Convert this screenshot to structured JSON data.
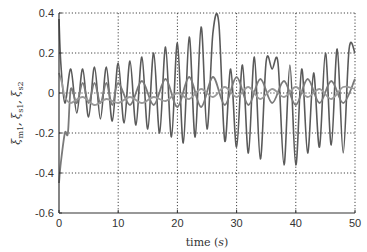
{
  "chart_data": {
    "type": "line",
    "title": "",
    "xlabel": "time (s)",
    "xlabel_main": "time",
    "xlabel_unit": "s",
    "ylabel": "ξm1, ξs1, ξs2",
    "ylabel_parts": [
      "ξ",
      "m1",
      ", ξ",
      "s1",
      ", ξ",
      "s2"
    ],
    "xlim": [
      0,
      50
    ],
    "ylim": [
      -0.6,
      0.4
    ],
    "xticks": [
      0,
      10,
      20,
      30,
      40,
      50
    ],
    "yticks": [
      -0.6,
      -0.4,
      -0.2,
      0,
      0.2,
      0.4
    ],
    "xtick_labels": [
      "0",
      "10",
      "20",
      "30",
      "40",
      "50"
    ],
    "ytick_labels": [
      "-0.6",
      "-0.4",
      "-0.2",
      "0",
      "0.2",
      "0.4"
    ],
    "grid": true,
    "legend": null,
    "series": [
      {
        "name": "ξm1",
        "color": "#5a5a5a",
        "description": "large oscillation, amplitude growing from ~0.12 to ~0.35 peak, troughs to ~-0.35; initial transient from 0.37",
        "x": [
          0,
          0.3,
          1,
          2,
          3,
          4,
          5,
          6,
          7,
          8,
          9,
          10,
          11,
          12,
          13,
          14,
          15,
          16,
          17,
          18,
          19,
          20,
          21,
          22,
          23,
          24,
          25,
          26,
          27,
          28,
          29,
          30,
          31,
          32,
          33,
          34,
          35,
          36,
          37,
          38,
          39,
          40,
          41,
          42,
          43,
          44,
          45,
          46,
          47,
          48,
          49,
          50
        ],
        "values": [
          0.37,
          0.15,
          -0.05,
          0.12,
          -0.1,
          0.12,
          -0.12,
          0.13,
          -0.13,
          0.13,
          -0.14,
          0.15,
          -0.15,
          0.16,
          -0.16,
          0.18,
          -0.18,
          0.2,
          -0.2,
          0.23,
          -0.22,
          0.25,
          -0.25,
          0.28,
          -0.22,
          0.33,
          -0.18,
          0.3,
          0.35,
          -0.24,
          0.12,
          -0.27,
          0.14,
          -0.3,
          0.18,
          -0.33,
          0.16,
          0.12,
          0.15,
          -0.36,
          0.14,
          -0.36,
          0.12,
          -0.3,
          0.1,
          -0.27,
          0.2,
          -0.26,
          0.22,
          -0.3,
          0.22,
          0.2
        ]
      },
      {
        "name": "ξs1",
        "color": "#7a7a7a",
        "description": "medium oscillation around 0, amplitude ~0.05-0.1; initial transient dipping to -0.45",
        "x": [
          0,
          0.3,
          1,
          1.5,
          2,
          3,
          4,
          5,
          6,
          7,
          8,
          9,
          10,
          12,
          14,
          16,
          18,
          20,
          22,
          24,
          26,
          28,
          30,
          32,
          34,
          36,
          38,
          40,
          42,
          44,
          46,
          48,
          50
        ],
        "values": [
          -0.45,
          -0.35,
          -0.2,
          -0.2,
          0.02,
          -0.05,
          0.05,
          -0.05,
          0.05,
          -0.05,
          0.05,
          -0.06,
          0.05,
          -0.06,
          0.06,
          -0.06,
          0.07,
          -0.07,
          0.08,
          -0.07,
          0.08,
          -0.06,
          0.08,
          -0.06,
          0.07,
          -0.05,
          0.06,
          -0.06,
          0.07,
          -0.05,
          0.06,
          -0.05,
          0.07
        ]
      },
      {
        "name": "ξs2",
        "color": "#9a9a9a",
        "description": "small oscillation slightly below 0, ~-0.05 to 0.03",
        "x": [
          0,
          0.5,
          1,
          2,
          4,
          6,
          8,
          10,
          12,
          14,
          16,
          18,
          20,
          22,
          24,
          26,
          28,
          30,
          32,
          34,
          36,
          38,
          40,
          42,
          44,
          46,
          48,
          50
        ],
        "values": [
          0.1,
          0.05,
          -0.02,
          -0.05,
          -0.02,
          -0.06,
          -0.03,
          -0.05,
          -0.02,
          -0.05,
          -0.02,
          -0.04,
          0.0,
          -0.03,
          0.02,
          -0.02,
          0.03,
          -0.02,
          0.03,
          -0.03,
          0.02,
          -0.02,
          0.03,
          -0.02,
          0.02,
          -0.03,
          0.03,
          0.02
        ]
      }
    ]
  }
}
